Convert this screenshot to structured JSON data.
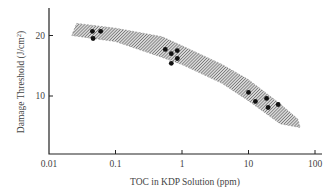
{
  "chart_data": {
    "type": "scatter",
    "title": "",
    "xlabel": "TOC in KDP Solution (ppm)",
    "ylabel": "Damage Threshold (J/cm²)",
    "ylabel_main": "Damage Threshold (J/cm",
    "ylabel_sup": "2",
    "ylabel_end": ")",
    "xscale": "log",
    "xlim": [
      0.01,
      100
    ],
    "ylim": [
      0,
      24.5
    ],
    "grid": false,
    "legend": null,
    "x_ticks": [
      {
        "value": 0.01,
        "label": "0.01"
      },
      {
        "value": 0.1,
        "label": "0.1"
      },
      {
        "value": 1,
        "label": "1"
      },
      {
        "value": 10,
        "label": "10"
      },
      {
        "value": 100,
        "label": "100"
      }
    ],
    "y_ticks": [
      {
        "value": 10,
        "label": "10"
      },
      {
        "value": 20,
        "label": "20"
      }
    ],
    "series": [
      {
        "name": "Measured damage threshold",
        "type": "scatter",
        "points": [
          {
            "x": 0.045,
            "y": 20.7
          },
          {
            "x": 0.06,
            "y": 20.7
          },
          {
            "x": 0.046,
            "y": 19.5
          },
          {
            "x": 0.56,
            "y": 17.7
          },
          {
            "x": 0.69,
            "y": 17.0
          },
          {
            "x": 0.85,
            "y": 17.5
          },
          {
            "x": 0.85,
            "y": 16.2
          },
          {
            "x": 0.69,
            "y": 15.4
          },
          {
            "x": 10.0,
            "y": 10.6
          },
          {
            "x": 12.7,
            "y": 9.1
          },
          {
            "x": 18.7,
            "y": 9.6
          },
          {
            "x": 19.7,
            "y": 8.1
          },
          {
            "x": 28.0,
            "y": 8.6
          }
        ]
      },
      {
        "name": "Trend band (hatched)",
        "type": "area",
        "upper": [
          {
            "x": 0.026,
            "y": 22.0
          },
          {
            "x": 0.1,
            "y": 21.2
          },
          {
            "x": 0.5,
            "y": 19.8
          },
          {
            "x": 1.0,
            "y": 18.3
          },
          {
            "x": 4.0,
            "y": 15.2
          },
          {
            "x": 10.0,
            "y": 12.7
          },
          {
            "x": 30.0,
            "y": 8.7
          },
          {
            "x": 55.0,
            "y": 6.2
          }
        ],
        "lower": [
          {
            "x": 0.022,
            "y": 20.0
          },
          {
            "x": 0.1,
            "y": 19.0
          },
          {
            "x": 0.5,
            "y": 16.4
          },
          {
            "x": 1.0,
            "y": 15.2
          },
          {
            "x": 4.0,
            "y": 12.1
          },
          {
            "x": 10.0,
            "y": 9.2
          },
          {
            "x": 30.0,
            "y": 5.4
          },
          {
            "x": 60.0,
            "y": 4.8
          }
        ]
      }
    ]
  },
  "layout": {
    "plot_left": 49,
    "plot_right": 322,
    "plot_top": 8,
    "plot_bottom": 154,
    "x_decade_px": 66.5,
    "y_px_per_unit": 6.05,
    "y_zero_px": 156.5,
    "colors": {
      "axis": "#222222",
      "text": "#444444",
      "dot": "#111111",
      "hatch": "#555555"
    }
  }
}
